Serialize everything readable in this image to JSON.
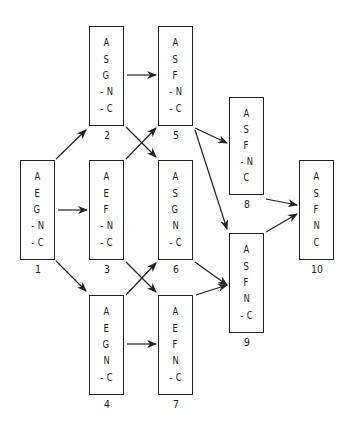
{
  "diagram": {
    "type": "directed-graph",
    "nodes": [
      {
        "id": "1",
        "label": "1",
        "lines": [
          "A",
          "E",
          "G",
          "- N",
          "- C"
        ],
        "box": [
          20,
          160,
          35,
          100
        ]
      },
      {
        "id": "2",
        "label": "2",
        "lines": [
          "A",
          "S",
          "G",
          "- N",
          "- C"
        ],
        "box": [
          89,
          26,
          35,
          100
        ]
      },
      {
        "id": "3",
        "label": "3",
        "lines": [
          "A",
          "E",
          "F",
          "- N",
          "- C"
        ],
        "box": [
          89,
          160,
          35,
          100
        ]
      },
      {
        "id": "4",
        "label": "4",
        "lines": [
          "A",
          "E",
          "G",
          "N",
          "- C"
        ],
        "box": [
          89,
          295,
          35,
          100
        ]
      },
      {
        "id": "5",
        "label": "5",
        "lines": [
          "A",
          "S",
          "F",
          "- N",
          "- C"
        ],
        "box": [
          158,
          26,
          35,
          100
        ]
      },
      {
        "id": "6",
        "label": "6",
        "lines": [
          "A",
          "S",
          "G",
          "N",
          "- C"
        ],
        "box": [
          158,
          160,
          35,
          100
        ]
      },
      {
        "id": "7",
        "label": "7",
        "lines": [
          "A",
          "E",
          "F",
          "N",
          "- C"
        ],
        "box": [
          158,
          295,
          35,
          100
        ]
      },
      {
        "id": "8",
        "label": "8",
        "lines": [
          "A",
          "S",
          "F",
          "- N",
          "C"
        ],
        "box": [
          229,
          97,
          35,
          98
        ]
      },
      {
        "id": "9",
        "label": "9",
        "lines": [
          "A",
          "S",
          "F",
          "N",
          "- C"
        ],
        "box": [
          229,
          233,
          35,
          100
        ]
      },
      {
        "id": "10",
        "label": "10",
        "lines": [
          "A",
          "S",
          "F",
          "N",
          "C"
        ],
        "box": [
          299,
          160,
          35,
          100
        ]
      }
    ],
    "edges": [
      {
        "from": "1",
        "to": "2",
        "path": [
          56,
          159,
          86,
          130
        ]
      },
      {
        "from": "1",
        "to": "3",
        "path": [
          58,
          210,
          87,
          210
        ]
      },
      {
        "from": "1",
        "to": "4",
        "path": [
          56,
          261,
          86,
          291
        ]
      },
      {
        "from": "2",
        "to": "5",
        "path": [
          127,
          75,
          156,
          75
        ]
      },
      {
        "from": "2",
        "to": "6",
        "path": [
          126,
          127,
          156,
          157
        ]
      },
      {
        "from": "3",
        "to": "5",
        "path": [
          126,
          159,
          156,
          128
        ]
      },
      {
        "from": "3",
        "to": "7",
        "path": [
          126,
          262,
          156,
          292
        ]
      },
      {
        "from": "4",
        "to": "6",
        "path": [
          126,
          295,
          156,
          263
        ]
      },
      {
        "from": "4",
        "to": "7",
        "path": [
          127,
          344,
          156,
          344
        ]
      },
      {
        "from": "5",
        "to": "8",
        "path": [
          195,
          128,
          227,
          143
        ]
      },
      {
        "from": "5",
        "to": "9",
        "path": [
          195,
          130,
          227,
          229
        ]
      },
      {
        "from": "6",
        "to": "9",
        "path": [
          195,
          262,
          227,
          285
        ]
      },
      {
        "from": "7",
        "to": "9",
        "path": [
          196,
          295,
          227,
          285
        ]
      },
      {
        "from": "8",
        "to": "10",
        "path": [
          266,
          199,
          297,
          205
        ]
      },
      {
        "from": "9",
        "to": "10",
        "path": [
          266,
          232,
          297,
          214
        ]
      }
    ],
    "stroke_color": "#222222",
    "background_color": "#ffffff"
  }
}
